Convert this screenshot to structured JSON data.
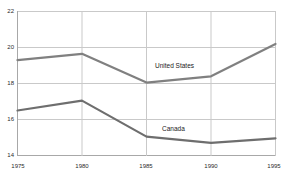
{
  "chart_data": {
    "type": "line",
    "title": "",
    "subtitle": "",
    "xlabel": "",
    "ylabel": "",
    "x": [
      1975,
      1980,
      1985,
      1990,
      1995
    ],
    "xtick_labels": [
      "1975",
      "1980",
      "1985",
      "1990",
      "1995"
    ],
    "ytick_labels": [
      "22",
      "20",
      "18",
      "16",
      "14"
    ],
    "yticks": [
      22,
      20,
      18,
      16,
      14
    ],
    "xlim": [
      1975,
      1995
    ],
    "ylim": [
      14,
      22
    ],
    "grid": true,
    "legend": "inline-labels",
    "series": [
      {
        "name": "United States",
        "color": "#808080",
        "values": [
          19.3,
          19.65,
          18.05,
          18.4,
          20.2
        ],
        "label_text": "United States"
      },
      {
        "name": "Canada",
        "color": "#6e6e6e",
        "values": [
          16.5,
          17.05,
          15.05,
          14.7,
          14.95
        ],
        "label_text": "Canada"
      }
    ]
  },
  "axes": {
    "ytick_0": "22",
    "ytick_1": "20",
    "ytick_2": "18",
    "ytick_3": "16",
    "ytick_4": "14",
    "xtick_0": "1975",
    "xtick_1": "1980",
    "xtick_2": "1985",
    "xtick_3": "1990",
    "xtick_4": "1995"
  },
  "labels": {
    "us": "United States",
    "canada": "Canada"
  },
  "colors": {
    "background": "#ffffff",
    "gridline": "#c9c9c9",
    "axis": "#a8a8a8",
    "series_us": "#808080",
    "series_canada": "#6e6e6e",
    "text": "#2b2b2b"
  }
}
